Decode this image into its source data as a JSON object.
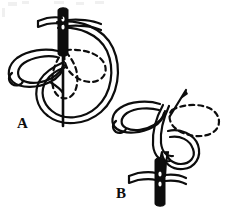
{
  "figure": {
    "background_color": "#ffffff",
    "ink_color": "#0d0d0d",
    "line_weight_px": 2.2,
    "panels": [
      {
        "id": "A",
        "label": "A",
        "label_x": 17,
        "label_y": 116,
        "caption": "",
        "elements": [
          {
            "name": "needle",
            "type": "solid-needle",
            "orientation": "vertical",
            "eye_visible": true
          },
          {
            "name": "working-thread",
            "type": "large-loop",
            "shape": "circle"
          },
          {
            "name": "completed-petal",
            "type": "solid-outline-petal",
            "direction": "left"
          },
          {
            "name": "planned-petal-center",
            "type": "dashed-petal",
            "direction": "down"
          },
          {
            "name": "planned-petal-right",
            "type": "dashed-petal",
            "direction": "right"
          },
          {
            "name": "thread-tail",
            "type": "thread-end",
            "position": "upper-left"
          }
        ]
      },
      {
        "id": "B",
        "label": "B",
        "label_x": 116,
        "label_y": 186,
        "caption": "",
        "elements": [
          {
            "name": "needle",
            "type": "solid-needle",
            "orientation": "vertical",
            "eye_visible": true
          },
          {
            "name": "needle-tip",
            "type": "thin-needle",
            "orientation": "diagonal"
          },
          {
            "name": "working-thread",
            "type": "interlocked-loop",
            "shape": "knot"
          },
          {
            "name": "completed-petal",
            "type": "solid-outline-petal",
            "direction": "left"
          },
          {
            "name": "planned-petal-right",
            "type": "dashed-petal",
            "direction": "right"
          },
          {
            "name": "thread-tail",
            "type": "thread-end",
            "position": "lower-left"
          }
        ]
      }
    ],
    "stroke_styles": {
      "solid": "continuous line",
      "dashed": "dashed line indicating planned stitch"
    },
    "dash_pattern": "5,4"
  }
}
